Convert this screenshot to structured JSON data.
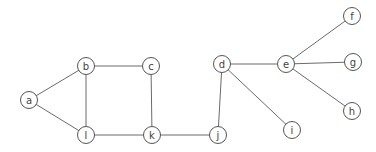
{
  "diagram": {
    "type": "undirected-graph",
    "node_radius": 8.5,
    "colors": {
      "edge": "#6a6a6a",
      "node_stroke": "#555555",
      "node_fill": "#ffffff",
      "label": "#444444"
    },
    "nodes": [
      {
        "id": "a",
        "label": "a",
        "x": 29,
        "y": 100
      },
      {
        "id": "b",
        "label": "b",
        "x": 86,
        "y": 66
      },
      {
        "id": "c",
        "label": "c",
        "x": 151,
        "y": 66
      },
      {
        "id": "l",
        "label": "l",
        "x": 86,
        "y": 135
      },
      {
        "id": "k",
        "label": "k",
        "x": 152,
        "y": 135
      },
      {
        "id": "j",
        "label": "j",
        "x": 218,
        "y": 135
      },
      {
        "id": "d",
        "label": "d",
        "x": 222,
        "y": 64
      },
      {
        "id": "e",
        "label": "e",
        "x": 286,
        "y": 64
      },
      {
        "id": "i",
        "label": "i",
        "x": 292,
        "y": 130
      },
      {
        "id": "f",
        "label": "f",
        "x": 352,
        "y": 16
      },
      {
        "id": "g",
        "label": "g",
        "x": 353,
        "y": 62
      },
      {
        "id": "h",
        "label": "h",
        "x": 352,
        "y": 111
      }
    ],
    "edges": [
      [
        "a",
        "b"
      ],
      [
        "a",
        "l"
      ],
      [
        "b",
        "c"
      ],
      [
        "b",
        "l"
      ],
      [
        "c",
        "k"
      ],
      [
        "l",
        "k"
      ],
      [
        "k",
        "j"
      ],
      [
        "j",
        "d"
      ],
      [
        "d",
        "e"
      ],
      [
        "d",
        "i"
      ],
      [
        "e",
        "f"
      ],
      [
        "e",
        "g"
      ],
      [
        "e",
        "h"
      ]
    ]
  }
}
